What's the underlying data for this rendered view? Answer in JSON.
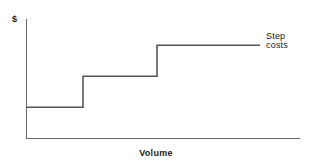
{
  "figure": {
    "width": 312,
    "height": 166,
    "background": "#ffffff",
    "line_color": "#555555",
    "axis_color": "#6b6b6b",
    "text_color": "#1a1a1a"
  },
  "labels": {
    "y_axis": "$",
    "x_axis": "Volume",
    "series_line1": "Step",
    "series_line2": "costs"
  },
  "chart_data": {
    "type": "line",
    "title": "",
    "subtitle": "",
    "xlabel": "Volume",
    "ylabel": "$",
    "grid": false,
    "legend_position": "right-inline",
    "legend_entries": [
      "Step costs"
    ],
    "annotations": [
      "Step costs"
    ],
    "xlim": [
      0,
      100
    ],
    "ylim": [
      0,
      100
    ],
    "axis_ticks": {
      "x": [],
      "y": []
    },
    "series": [
      {
        "name": "Step costs",
        "shape": "step-post",
        "x": [
          0,
          20.8,
          20.8,
          47.8,
          47.8,
          85.4
        ],
        "y": [
          26.1,
          26.1,
          52.1,
          52.1,
          78.2,
          78.2
        ],
        "steps": [
          {
            "index": 1,
            "x_start": 0,
            "x_end": 20.8,
            "level": 26.1
          },
          {
            "index": 2,
            "x_start": 20.8,
            "x_end": 47.8,
            "level": 52.1
          },
          {
            "index": 3,
            "x_start": 47.8,
            "x_end": 85.4,
            "level": 78.2
          }
        ]
      }
    ]
  },
  "geometry": {
    "axis_x": 26,
    "axis_y": 138,
    "axis_top": 19,
    "axis_right": 300,
    "step_levels_px": [
      107,
      76,
      45
    ],
    "risers_px": [
      83,
      157
    ],
    "step_start_px": 26,
    "step_end_px": 260
  }
}
